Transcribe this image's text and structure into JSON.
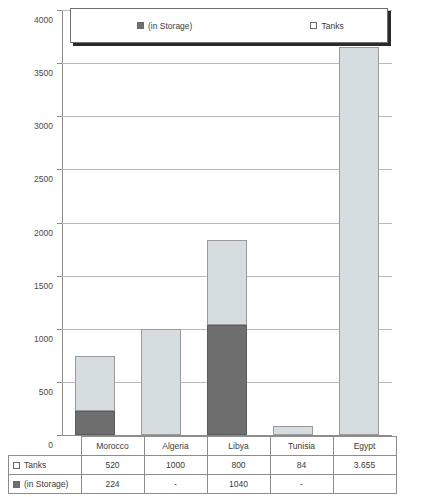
{
  "chart_data": {
    "type": "bar",
    "subtype": "stacked",
    "title": "",
    "xlabel": "",
    "ylabel": "",
    "ylim": [
      0,
      4000
    ],
    "ytick_step": 500,
    "yticks": [
      "0",
      "500",
      "1000",
      "1500",
      "2000",
      "2500",
      "3000",
      "3500",
      "4000"
    ],
    "grid": true,
    "legend_position": "top",
    "categories": [
      "Morocco",
      "Algeria",
      "Libya",
      "Tunisia",
      "Egypt"
    ],
    "series": [
      {
        "name": "Tanks",
        "color": "#d6dde0",
        "values": [
          520,
          1000,
          800,
          84,
          3655
        ],
        "display_values": [
          "520",
          "1000",
          "800",
          "84",
          "3.655"
        ]
      },
      {
        "name": "(in Storage)",
        "color": "#6e6e6e",
        "values": [
          224,
          0,
          1040,
          0,
          0
        ],
        "display_values": [
          "224",
          "-",
          "1040",
          "-",
          ""
        ]
      }
    ]
  },
  "legend": {
    "items": [
      {
        "label": "(in Storage)",
        "swatch": "dark-gray-swatch-icon"
      },
      {
        "label": "Tanks",
        "swatch": "light-gray-swatch-icon"
      }
    ]
  },
  "table": {
    "column_headers": [
      "Morocco",
      "Algeria",
      "Libya",
      "Tunisia",
      "Egypt"
    ],
    "rows": [
      {
        "label": "Tanks",
        "cells": [
          "520",
          "1000",
          "800",
          "84",
          "3.655"
        ]
      },
      {
        "label": "(in Storage)",
        "cells": [
          "224",
          "-",
          "1040",
          "-",
          ""
        ]
      }
    ]
  },
  "colors": {
    "tanks": "#d6dde0",
    "storage": "#6e6e6e",
    "axis": "#8d8d8d",
    "grid": "#b9b9b9"
  }
}
